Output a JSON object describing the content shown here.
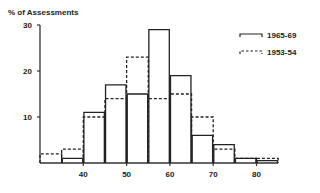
{
  "chart_data": {
    "type": "bar",
    "subtype": "histogram",
    "title": "",
    "ylabel": "% of Assessments",
    "xlabel": "",
    "ylim": [
      0,
      30
    ],
    "xlim": [
      30,
      85
    ],
    "yticks": [
      10,
      20,
      30
    ],
    "xticks": [
      40,
      50,
      60,
      70,
      80
    ],
    "bin_edges": [
      30,
      35,
      40,
      45,
      50,
      55,
      60,
      65,
      70,
      75,
      80,
      85
    ],
    "categories": [
      "30-35",
      "35-40",
      "40-45",
      "45-50",
      "50-55",
      "55-60",
      "60-65",
      "65-70",
      "70-75",
      "75-80",
      "80-85"
    ],
    "series": [
      {
        "name": "1965-69",
        "style": "solid",
        "values": [
          0,
          1,
          11,
          17,
          15,
          29,
          19,
          6,
          4,
          1,
          0.5
        ]
      },
      {
        "name": "1953-54",
        "style": "dashed",
        "values": [
          2,
          3,
          10,
          14,
          23,
          14,
          15,
          10,
          3,
          1,
          1
        ]
      }
    ],
    "legend": {
      "position": "upper right",
      "entries": [
        "1965-69",
        "1953-54"
      ]
    },
    "grid": false
  }
}
